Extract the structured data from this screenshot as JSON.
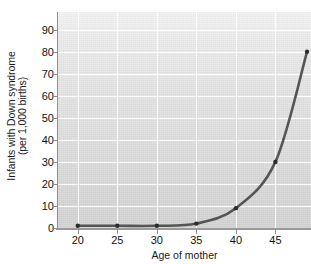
{
  "chart_data": {
    "type": "line",
    "title": "",
    "xlabel": "Age of mother",
    "ylabel_lines": [
      "Infants with Down syndrome",
      "(per 1,000 births)"
    ],
    "ylabel": "Infants with Down syndrome (per 1,000 births)",
    "x": [
      20,
      25,
      30,
      35,
      40,
      45,
      49
    ],
    "values": [
      1,
      1,
      1,
      2,
      9,
      30,
      80
    ],
    "series": [
      {
        "name": "Infants with Down syndrome per 1,000 births",
        "x": [
          20,
          25,
          30,
          35,
          40,
          45,
          49
        ],
        "values": [
          1,
          1,
          1,
          2,
          9,
          30,
          80
        ]
      }
    ],
    "markers": [
      {
        "x": 20,
        "y": 1
      },
      {
        "x": 25,
        "y": 1
      },
      {
        "x": 30,
        "y": 1
      },
      {
        "x": 35,
        "y": 2
      },
      {
        "x": 40,
        "y": 9
      },
      {
        "x": 45,
        "y": 30
      },
      {
        "x": 49,
        "y": 80
      }
    ],
    "xlim": [
      17.5,
      49.5
    ],
    "ylim": [
      0,
      98
    ],
    "xticks": [
      20,
      25,
      30,
      35,
      40,
      45
    ],
    "xtick_labels": [
      "20",
      "25",
      "30",
      "35",
      "40",
      "45"
    ],
    "yticks": [
      0,
      10,
      20,
      30,
      40,
      50,
      60,
      70,
      80,
      90
    ],
    "ytick_labels": [
      "0",
      "10",
      "20",
      "30",
      "40",
      "50",
      "60",
      "70",
      "80",
      "90"
    ],
    "grid": true,
    "grid_color": "#ffffff",
    "legend": "none",
    "line_color": "#555555",
    "marker_color": "#2b2b2b",
    "plot_background": "#e4e4e4",
    "line_width": 2.6,
    "marker_size": 2.2
  }
}
